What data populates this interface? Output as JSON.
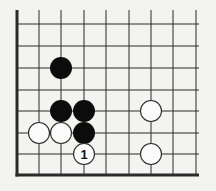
{
  "diagram": {
    "type": "go-board-fragment",
    "colors": {
      "background": "#f3f3f1",
      "line": "#2a2a2a",
      "black_stone": "#0c0c0c",
      "white_stone": "#fbfbfb"
    },
    "grid": {
      "columns_x": [
        17,
        39,
        61,
        84,
        106,
        129,
        151,
        173,
        196
      ],
      "rows_y": [
        24,
        46,
        68,
        90,
        111,
        133,
        154,
        175
      ],
      "top_open_y": 10,
      "right_open_x": 199,
      "left_edge": "thick",
      "bottom_edge": "thick"
    },
    "stone_radius": 11,
    "stones": [
      {
        "color": "black",
        "col": 2,
        "row": 2,
        "label": ""
      },
      {
        "color": "black",
        "col": 2,
        "row": 4,
        "label": ""
      },
      {
        "color": "black",
        "col": 3,
        "row": 4,
        "label": ""
      },
      {
        "color": "black",
        "col": 3,
        "row": 5,
        "label": ""
      },
      {
        "color": "white",
        "col": 1,
        "row": 5,
        "label": ""
      },
      {
        "color": "white",
        "col": 2,
        "row": 5,
        "label": ""
      },
      {
        "color": "white",
        "col": 3,
        "row": 6,
        "label": "1"
      },
      {
        "color": "white",
        "col": 6,
        "row": 4,
        "label": ""
      },
      {
        "color": "white",
        "col": 6,
        "row": 6,
        "label": ""
      }
    ]
  }
}
